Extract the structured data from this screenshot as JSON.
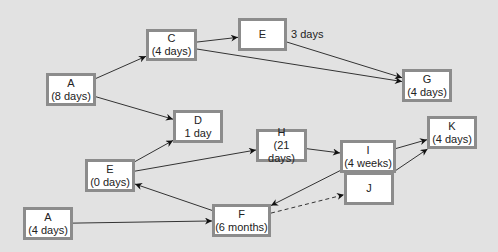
{
  "diagram": {
    "type": "activity-network",
    "background_color": "#e2e2e2",
    "node_border_color": "#8c8c8c",
    "nodes": [
      {
        "id": "n_a8",
        "name": "A",
        "duration": "(8 days)",
        "x": 46,
        "y": 73,
        "w": 50,
        "h": 33
      },
      {
        "id": "n_c",
        "name": "C",
        "duration": "(4 days)",
        "x": 146,
        "y": 29,
        "w": 51,
        "h": 32
      },
      {
        "id": "n_e1",
        "name": "E",
        "duration": "",
        "x": 238,
        "y": 18,
        "w": 49,
        "h": 33
      },
      {
        "id": "n_g",
        "name": "G",
        "duration": "(4 days)",
        "x": 402,
        "y": 69,
        "w": 50,
        "h": 33
      },
      {
        "id": "n_d",
        "name": "D",
        "duration": "1 day",
        "x": 173,
        "y": 110,
        "w": 50,
        "h": 33
      },
      {
        "id": "n_h",
        "name": "H",
        "duration": "(21 days)",
        "x": 256,
        "y": 129,
        "w": 51,
        "h": 33
      },
      {
        "id": "n_i",
        "name": "I",
        "duration": "(4 weeks)",
        "x": 340,
        "y": 140,
        "w": 56,
        "h": 33
      },
      {
        "id": "n_k",
        "name": "K",
        "duration": "(4 days)",
        "x": 427,
        "y": 116,
        "w": 50,
        "h": 33
      },
      {
        "id": "n_e0",
        "name": "E",
        "duration": "(0 days)",
        "x": 85,
        "y": 159,
        "w": 50,
        "h": 33
      },
      {
        "id": "n_j",
        "name": "J",
        "duration": "",
        "x": 344,
        "y": 172,
        "w": 50,
        "h": 33
      },
      {
        "id": "n_a4",
        "name": "A",
        "duration": "(4 days)",
        "x": 23,
        "y": 207,
        "w": 50,
        "h": 33
      },
      {
        "id": "n_f",
        "name": "F",
        "duration": "(6 months)",
        "x": 212,
        "y": 204,
        "w": 59,
        "h": 33
      }
    ],
    "edges": [
      {
        "from": "n_a8",
        "to": "n_c",
        "style": "solid"
      },
      {
        "from": "n_a8",
        "to": "n_d",
        "style": "solid"
      },
      {
        "from": "n_c",
        "to": "n_e1",
        "style": "solid"
      },
      {
        "from": "n_c",
        "to": "n_g",
        "style": "solid"
      },
      {
        "from": "n_e1",
        "to": "n_g",
        "style": "solid",
        "label": "3 days"
      },
      {
        "from": "n_e0",
        "to": "n_d",
        "style": "solid"
      },
      {
        "from": "n_e0",
        "to": "n_h",
        "style": "solid"
      },
      {
        "from": "n_h",
        "to": "n_i",
        "style": "solid"
      },
      {
        "from": "n_i",
        "to": "n_k",
        "style": "solid"
      },
      {
        "from": "n_i",
        "to": "n_f",
        "style": "solid"
      },
      {
        "from": "n_j",
        "to": "n_k",
        "style": "solid"
      },
      {
        "from": "n_f",
        "to": "n_e0",
        "style": "solid"
      },
      {
        "from": "n_a4",
        "to": "n_f",
        "style": "solid"
      },
      {
        "from": "n_f",
        "to": "n_j",
        "style": "dashed"
      }
    ],
    "edge_labels": [
      {
        "text": "3 days",
        "x": 291,
        "y": 28
      }
    ]
  }
}
